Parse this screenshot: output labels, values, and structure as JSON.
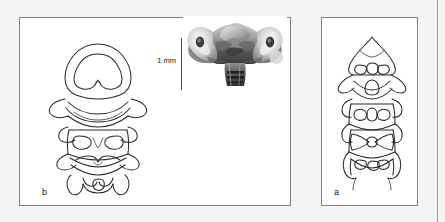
{
  "figure": {
    "type": "scientific-plate",
    "background_color": "#f4f4f2",
    "panel_border_color": "#838383",
    "ink_color": "#2a2a2a",
    "panels": [
      {
        "id": "b",
        "label": "b",
        "content": "line drawing of articulated vertebral series, dorsal view"
      },
      {
        "id": "a",
        "label": "a",
        "content": "line drawing of articulated vertebral series, dorsal view"
      }
    ],
    "photograph": {
      "name": "specimen-photograph",
      "description": "grayscale photomicrograph of vertebral specimen, anterior view"
    },
    "scale_bar": {
      "label": "1 mm",
      "orientation": "vertical",
      "length_px": 52
    }
  }
}
